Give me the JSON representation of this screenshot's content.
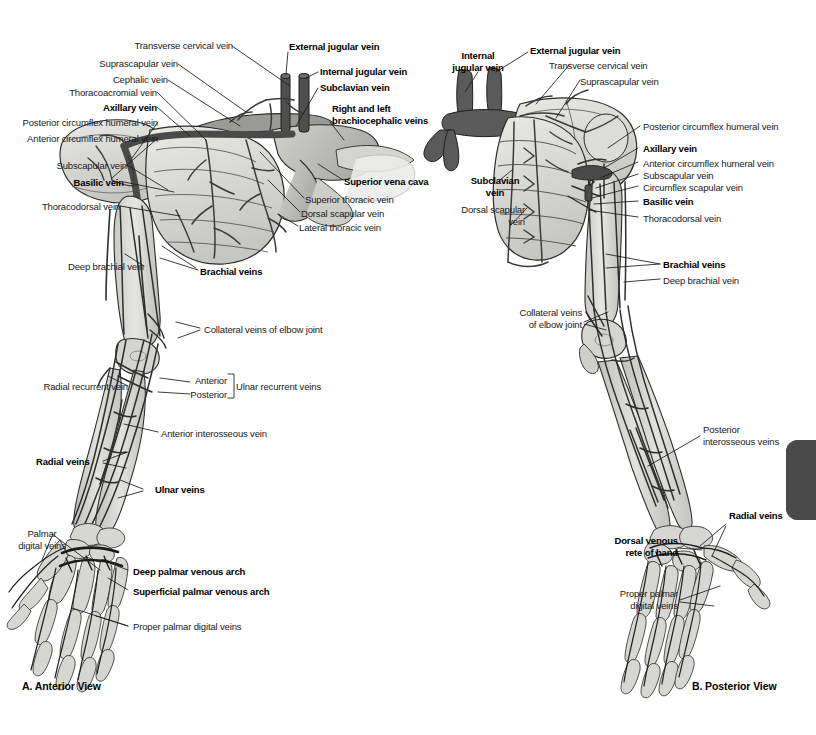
{
  "figure": {
    "background_color": "#ffffff",
    "ink_color": "#1a1a1a",
    "bone_fill": "#d8d8d6",
    "vein_dark": "#4a4a4a",
    "edge_tab_color": "#4a4a4a"
  },
  "panels": {
    "a": {
      "caption": "A. Anterior View",
      "labels": {
        "transverse_cervical_vein": "Transverse cervical vein",
        "suprascapular_vein": "Suprascapular vein",
        "cephalic_vein": "Cephalic vein",
        "thoracoacromial_vein": "Thoracoacromial vein",
        "axillary_vein": "Axillary vein",
        "posterior_circumflex_humeral_vein": "Posterior circumflex humeral vein",
        "anterior_circumflex_humeral_vein": "Anterior circumflex humeral vein",
        "subscapular_vein": "Subscapular vein",
        "basilic_vein": "Basilic vein",
        "thoracodorsal_vein": "Thoracodorsal vein",
        "external_jugular_vein": "External jugular vein",
        "internal_jugular_vein": "Internal jugular vein",
        "subclavian_vein": "Subclavian vein",
        "right_and_left_brachiocephalic_veins_1": "Right and left",
        "right_and_left_brachiocephalic_veins_2": "brachiocephalic veins",
        "superior_vena_cava": "Superior vena cava",
        "superior_thoracic_vein": "Superior thoracic vein",
        "dorsal_scapular_vein": "Dorsal scapular vein",
        "lateral_thoracic_vein": "Lateral thoracic vein",
        "deep_brachial_vein": "Deep brachial vein",
        "brachial_veins": "Brachial veins",
        "collateral_veins_of_elbow_joint": "Collateral veins of elbow joint",
        "radial_recurrent_vein": "Radial recurrent vein",
        "ulnar_recurrent_anterior": "Anterior",
        "ulnar_recurrent_posterior": "Posterior",
        "ulnar_recurrent_veins": "Ulnar recurrent veins",
        "anterior_interosseous_vein": "Anterior interosseous vein",
        "radial_veins": "Radial veins",
        "ulnar_veins": "Ulnar veins",
        "palmar_digital_veins_1": "Palmar",
        "palmar_digital_veins_2": "digital veins",
        "deep_palmar_venous_arch": "Deep palmar venous arch",
        "superficial_palmar_venous_arch": "Superficial palmar venous arch",
        "proper_palmar_digital_veins": "Proper palmar digital veins"
      }
    },
    "b": {
      "caption": "B. Posterior View",
      "labels": {
        "internal_jugular_vein_1": "Internal",
        "internal_jugular_vein_2": "jugular vein",
        "external_jugular_vein": "External jugular vein",
        "transverse_cervical_vein": "Transverse cervical vein",
        "suprascapular_vein": "Suprascapular vein",
        "posterior_circumflex_humeral_vein": "Posterior circumflex humeral vein",
        "axillary_vein": "Axillary vein",
        "anterior_circumflex_humeral_vein": "Anterior circumflex humeral vein",
        "subscapular_vein": "Subscapular vein",
        "circumflex_scapular_vein": "Circumflex scapular vein",
        "basilic_vein": "Basilic vein",
        "thoracodorsal_vein": "Thoracodorsal vein",
        "subclavian_vein_1": "Subclavian",
        "subclavian_vein_2": "vein",
        "dorsal_scapular_vein_1": "Dorsal scapular",
        "dorsal_scapular_vein_2": "vein",
        "brachial_veins": "Brachial veins",
        "deep_brachial_vein": "Deep brachial vein",
        "collateral_veins_1": "Collateral veins",
        "collateral_veins_2": "of elbow joint",
        "posterior_interosseous_veins_1": "Posterior",
        "posterior_interosseous_veins_2": "interosseous veins",
        "radial_veins": "Radial veins",
        "dorsal_venous_rete_1": "Dorsal venous",
        "dorsal_venous_rete_2": "rete of hand",
        "proper_palmar_digital_veins_1": "Proper palmar",
        "proper_palmar_digital_veins_2": "digital veins"
      }
    }
  }
}
